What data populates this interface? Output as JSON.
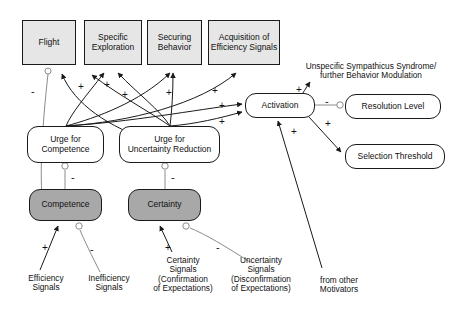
{
  "diagram": {
    "colors": {
      "box_fill": "#e6e6e6",
      "node_fill": "#ffffff",
      "state_fill": "#a8a8a8",
      "stroke": "#1a1a1a",
      "inhibit_stroke": "#8c8c8c"
    }
  },
  "behavior_boxes": [
    {
      "id": "flight",
      "label": "Flight",
      "x": 22,
      "y": 20,
      "w": 54,
      "h": 45
    },
    {
      "id": "specific",
      "label": "Specific\nExploration",
      "x": 84,
      "y": 20,
      "w": 58,
      "h": 45
    },
    {
      "id": "securing",
      "label": "Securing\nBehavior",
      "x": 147,
      "y": 20,
      "w": 55,
      "h": 45
    },
    {
      "id": "acquisition",
      "label": "Acquisition of\nEfficiency Signals",
      "x": 208,
      "y": 20,
      "w": 72,
      "h": 45
    }
  ],
  "urge_nodes": [
    {
      "id": "urge-competence",
      "label": "Urge for\nCompetence",
      "x": 27,
      "y": 126,
      "w": 77,
      "h": 37
    },
    {
      "id": "urge-uncertainty",
      "label": "Urge for\nUncertainty Reduction",
      "x": 119,
      "y": 126,
      "w": 101,
      "h": 37
    }
  ],
  "state_nodes": [
    {
      "id": "competence",
      "label": "Competence",
      "x": 29,
      "y": 189,
      "w": 73,
      "h": 32
    },
    {
      "id": "certainty",
      "label": "Certainty",
      "x": 128,
      "y": 189,
      "w": 73,
      "h": 32
    }
  ],
  "activation_nodes": [
    {
      "id": "activation",
      "label": "Activation",
      "x": 245,
      "y": 93,
      "w": 70,
      "h": 25
    },
    {
      "id": "resolution-level",
      "label": "Resolution Level",
      "x": 345,
      "y": 94,
      "w": 96,
      "h": 25
    },
    {
      "id": "selection-threshold",
      "label": "Selection Threshold",
      "x": 345,
      "y": 144,
      "w": 100,
      "h": 25
    }
  ],
  "text_labels": [
    {
      "id": "sympathicus",
      "label": "Unspecific Sympathicus Syndrome/\nfurther Behavior Modulation",
      "x": 292,
      "y": 62,
      "w": 158
    },
    {
      "id": "efficiency-signals",
      "label": "Efficiency\nSignals",
      "x": 18,
      "y": 274,
      "w": 56
    },
    {
      "id": "inefficiency-signals",
      "label": "Inefficiency\nSignals",
      "x": 78,
      "y": 274,
      "w": 62
    },
    {
      "id": "certainty-signals",
      "label": "Certainty\nSignals\n(Confirmation\nof Expectations)",
      "x": 146,
      "y": 256,
      "w": 74
    },
    {
      "id": "uncertainty-signals",
      "label": "Uncertainty\nSignals\n(Disconfirmation\nof Expectations)",
      "x": 220,
      "y": 256,
      "w": 82
    },
    {
      "id": "from-other-motivators",
      "label": "from other\nMotivators",
      "x": 308,
      "y": 276,
      "w": 62
    }
  ],
  "signs": [
    {
      "id": "s-flight-minus",
      "symbol": "-",
      "x": 31,
      "y": 86
    },
    {
      "id": "s-specific-1",
      "symbol": "+",
      "x": 78,
      "y": 82
    },
    {
      "id": "s-specific-2",
      "symbol": "+",
      "x": 104,
      "y": 80
    },
    {
      "id": "s-specific-3",
      "symbol": "+",
      "x": 122,
      "y": 90
    },
    {
      "id": "s-securing-1",
      "symbol": "+",
      "x": 166,
      "y": 88
    },
    {
      "id": "s-acquisition-1",
      "symbol": "+",
      "x": 212,
      "y": 86
    },
    {
      "id": "s-act-in-top",
      "symbol": "+",
      "x": 219,
      "y": 101
    },
    {
      "id": "s-act-in-bot",
      "symbol": "+",
      "x": 219,
      "y": 117
    },
    {
      "id": "s-sympathicus",
      "symbol": "+",
      "x": 296,
      "y": 85
    },
    {
      "id": "s-resolution-minus",
      "symbol": "-",
      "x": 325,
      "y": 96
    },
    {
      "id": "s-selection",
      "symbol": "+",
      "x": 325,
      "y": 119
    },
    {
      "id": "s-other-motivators",
      "symbol": "+",
      "x": 291,
      "y": 127
    },
    {
      "id": "s-competence-inhibit",
      "symbol": "-",
      "x": 71,
      "y": 172
    },
    {
      "id": "s-certainty-inhibit",
      "symbol": "-",
      "x": 171,
      "y": 172
    },
    {
      "id": "s-efficiency",
      "symbol": "+",
      "x": 42,
      "y": 243
    },
    {
      "id": "s-inefficiency",
      "symbol": "-",
      "x": 90,
      "y": 244
    },
    {
      "id": "s-certainty-sig",
      "symbol": "+",
      "x": 165,
      "y": 243
    },
    {
      "id": "s-uncertainty-sig",
      "symbol": "-",
      "x": 216,
      "y": 242
    }
  ]
}
